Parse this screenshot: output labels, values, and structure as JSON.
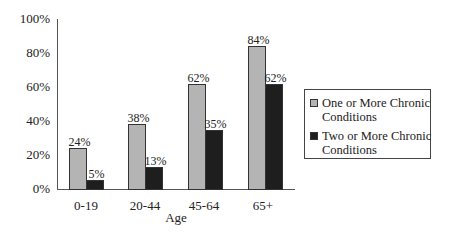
{
  "chart_data": {
    "type": "bar",
    "title": "",
    "xlabel": "Age",
    "ylabel": "",
    "categories": [
      "0-19",
      "20-44",
      "45-64",
      "65+"
    ],
    "series": [
      {
        "name": "One or More Chronic Conditions",
        "values": [
          24,
          38,
          62,
          84
        ],
        "color": "#b4b4b4",
        "labels": [
          "24%",
          "38%",
          "62%",
          "84%"
        ]
      },
      {
        "name": "Two or More Chronic Conditions",
        "values": [
          5,
          13,
          35,
          62
        ],
        "color": "#1e1e1e",
        "labels": [
          "5%",
          "13%",
          "35%",
          "62%"
        ]
      }
    ],
    "yticks": [
      "0%",
      "20%",
      "40%",
      "60%",
      "80%",
      "100%"
    ],
    "ylim": [
      0,
      100
    ],
    "grid": false,
    "legend_position": "right"
  }
}
